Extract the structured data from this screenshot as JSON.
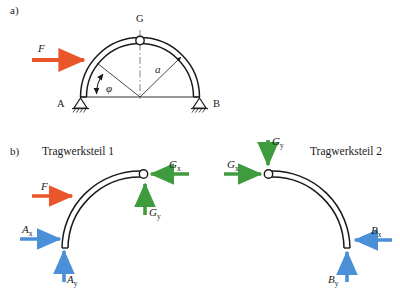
{
  "figure": {
    "panel_a": {
      "label": "a)",
      "node_left": "A",
      "node_right": "B",
      "node_top": "G",
      "force_label": "F",
      "radius_label": "a",
      "angle_label": "φ"
    },
    "panel_b": {
      "label": "b)",
      "part1_title": "Tragwerksteil 1",
      "part2_title": "Tragwerksteil 2",
      "part1_forces": {
        "applied": "F",
        "ax_base": "A",
        "ax_sub": "x",
        "ay_base": "A",
        "ay_sub": "y",
        "gx_base": "G",
        "gx_sub": "x",
        "gy_base": "G",
        "gy_sub": "y"
      },
      "part2_forces": {
        "gx_base": "G",
        "gx_sub": "x",
        "gy_base": "G",
        "gy_sub": "y",
        "bx_base": "B",
        "bx_sub": "x",
        "by_base": "B",
        "by_sub": "y"
      }
    },
    "colors": {
      "applied_force": "#E8562A",
      "reaction_force": "#4A90D9",
      "joint_force": "#3E9B3E",
      "structure": "#1a1a1a",
      "background": "#ffffff"
    }
  }
}
